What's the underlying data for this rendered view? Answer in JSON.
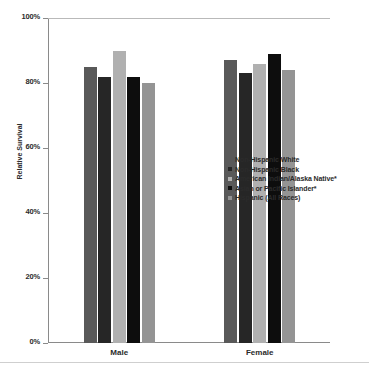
{
  "chart_data": {
    "type": "bar",
    "title": "",
    "xlabel": "",
    "ylabel": "Relative Survival",
    "ylim": [
      0,
      100
    ],
    "ytick_labels": [
      "100%",
      "80%",
      "60%",
      "40%",
      "20%",
      "0%"
    ],
    "ytick_values": [
      100,
      80,
      60,
      40,
      20,
      0
    ],
    "grid": "horizontal-top-only",
    "legend_position": "center-right",
    "categories": [
      "Male",
      "Female"
    ],
    "series": [
      {
        "name": "Non-Hispanic White",
        "color": "#595959",
        "values": [
          85,
          87
        ]
      },
      {
        "name": "Non-Hispanic Black",
        "color": "#262626",
        "values": [
          82,
          83
        ]
      },
      {
        "name": "American Indian/Alaska Native*",
        "color": "#b0b0b0",
        "values": [
          90,
          86
        ]
      },
      {
        "name": "Asian or Pacific Islander*",
        "color": "#0d0d0d",
        "values": [
          82,
          89
        ]
      },
      {
        "name": "Hispanic (All Races)",
        "color": "#949494",
        "values": [
          80,
          84
        ]
      }
    ]
  },
  "axis": {
    "y_title": "Relative Survival"
  }
}
